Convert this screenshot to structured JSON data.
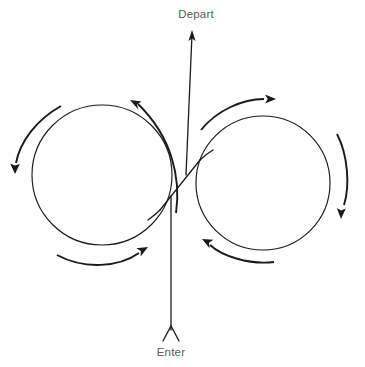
{
  "diagram": {
    "type": "traffic-flow-diagram",
    "background_color": "#ffffff",
    "line_color": "#1a1a1a",
    "label_color": "#5a5a5a",
    "labels": {
      "depart": "Depart",
      "enter": "Enter"
    },
    "nodes": [
      {
        "name": "left-roundabout",
        "center_x": 102,
        "center_y": 175,
        "radius": 70,
        "rotation": "counterclockwise"
      },
      {
        "name": "right-roundabout",
        "center_x": 263,
        "center_y": 183,
        "radius": 67,
        "rotation": "clockwise"
      }
    ],
    "flow_arrows": [
      {
        "name": "left-top-arrow",
        "direction": "up-left",
        "tip_x": 130,
        "tip_y": 100
      },
      {
        "name": "left-side-arrow",
        "direction": "down",
        "tip_x": 15,
        "tip_y": 168
      },
      {
        "name": "left-bottom-arrow",
        "direction": "up-right",
        "tip_x": 144,
        "tip_y": 250
      },
      {
        "name": "right-top-arrow",
        "direction": "right",
        "tip_x": 271,
        "tip_y": 99
      },
      {
        "name": "right-side-arrow",
        "direction": "down",
        "tip_x": 344,
        "tip_y": 214
      },
      {
        "name": "right-bottom-arrow",
        "direction": "up-left",
        "tip_x": 206,
        "tip_y": 243
      },
      {
        "name": "depart-arrow",
        "direction": "up",
        "tip_x": 192,
        "tip_y": 30
      },
      {
        "name": "enter-chevron",
        "direction": "up",
        "tip_x": 171,
        "tip_y": 325
      }
    ]
  }
}
